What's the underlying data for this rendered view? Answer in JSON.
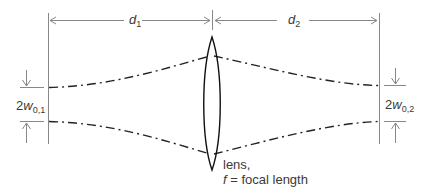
{
  "diagram": {
    "labels": {
      "d1": {
        "base": "d",
        "sub": "1"
      },
      "d2": {
        "base": "d",
        "sub": "2"
      },
      "waist1": {
        "prefix": "2",
        "var": "w",
        "sub": "0,1"
      },
      "waist2": {
        "prefix": "2",
        "var": "w",
        "sub": "0,2"
      },
      "lens_line1": "lens,",
      "lens_var": "f",
      "lens_line2": " = focal length"
    },
    "colors": {
      "line": "#888888",
      "beam": "#222222",
      "lens": "#111111",
      "text": "#3a3a3a"
    }
  }
}
